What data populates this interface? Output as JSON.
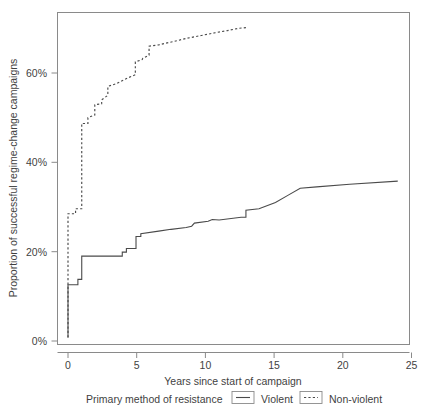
{
  "chart_data": {
    "type": "line",
    "title": "",
    "subtitle": "",
    "xlabel": "Years since start of campaign",
    "ylabel": "Proportion of successful regime-change campaigns",
    "xlim": [
      -0.45,
      25.0
    ],
    "ylim": [
      0,
      76
    ],
    "grid": false,
    "xticks": [
      0,
      5,
      10,
      15,
      20,
      25
    ],
    "xtick_labels": [
      "0",
      "5",
      "10",
      "15",
      "20",
      "25"
    ],
    "yticks": [
      0,
      20,
      40,
      60
    ],
    "ytick_labels": [
      "0%",
      "20%",
      "40%",
      "60%"
    ],
    "legend_position": "bottom",
    "legend_title": "Primary method of resistance",
    "series": [
      {
        "name": "Violent",
        "style": "solid",
        "color": "#4a4a4a",
        "points": [
          [
            0.0,
            0.8
          ],
          [
            0.0,
            12.6
          ],
          [
            0.72,
            12.6
          ],
          [
            0.72,
            13.8
          ],
          [
            1.0,
            13.8
          ],
          [
            1.0,
            19.0
          ],
          [
            3.95,
            19.0
          ],
          [
            3.95,
            19.9
          ],
          [
            4.25,
            19.9
          ],
          [
            4.25,
            20.7
          ],
          [
            4.95,
            20.7
          ],
          [
            4.95,
            23.4
          ],
          [
            5.3,
            23.4
          ],
          [
            5.3,
            24.0
          ],
          [
            6.6,
            24.6
          ],
          [
            7.5,
            25.0
          ],
          [
            8.6,
            25.4
          ],
          [
            9.0,
            25.7
          ],
          [
            9.2,
            26.4
          ],
          [
            10.2,
            26.8
          ],
          [
            10.5,
            27.2
          ],
          [
            11.0,
            27.1
          ],
          [
            12.6,
            27.7
          ],
          [
            12.95,
            27.7
          ],
          [
            12.95,
            29.3
          ],
          [
            13.9,
            29.6
          ],
          [
            15.1,
            31.0
          ],
          [
            16.0,
            32.6
          ],
          [
            16.9,
            34.2
          ],
          [
            18.1,
            34.5
          ],
          [
            20.5,
            35.1
          ],
          [
            24.0,
            35.8
          ]
        ]
      },
      {
        "name": "Non-violent",
        "style": "dashed",
        "color": "#4a4a4a",
        "points": [
          [
            0.0,
            0.8
          ],
          [
            0.0,
            28.5
          ],
          [
            0.55,
            28.5
          ],
          [
            0.55,
            29.6
          ],
          [
            1.0,
            29.6
          ],
          [
            1.0,
            48.7
          ],
          [
            1.45,
            48.7
          ],
          [
            1.45,
            50.0
          ],
          [
            1.95,
            50.6
          ],
          [
            1.95,
            52.9
          ],
          [
            2.45,
            53.1
          ],
          [
            2.45,
            54.0
          ],
          [
            2.9,
            55.0
          ],
          [
            2.9,
            57.0
          ],
          [
            3.5,
            57.6
          ],
          [
            4.35,
            58.9
          ],
          [
            4.9,
            59.6
          ],
          [
            4.9,
            62.5
          ],
          [
            5.4,
            63.0
          ],
          [
            5.45,
            63.3
          ],
          [
            5.9,
            64.0
          ],
          [
            5.9,
            66.0
          ],
          [
            6.6,
            66.3
          ],
          [
            7.6,
            67.0
          ],
          [
            8.7,
            67.8
          ],
          [
            9.7,
            68.4
          ],
          [
            10.7,
            69.0
          ],
          [
            11.6,
            69.5
          ],
          [
            12.4,
            70.0
          ],
          [
            13.1,
            70.2
          ]
        ]
      }
    ]
  },
  "axes": {
    "x_axis_title": "Years since start of campaign",
    "y_axis_title": "Proportion of successful regime-change campaigns"
  },
  "legend": {
    "title": "Primary method of resistance",
    "items": [
      {
        "label": "Violent",
        "style": "solid"
      },
      {
        "label": "Non-violent",
        "style": "dashed"
      }
    ]
  },
  "ticks": {
    "x": [
      "0",
      "5",
      "10",
      "15",
      "20",
      "25"
    ],
    "y": [
      "0%",
      "20%",
      "40%",
      "60%"
    ]
  },
  "colors": {
    "line": "#4a4a4a",
    "axis": "#8a8a8a",
    "text": "#3f3f3f",
    "background": "#ffffff"
  }
}
